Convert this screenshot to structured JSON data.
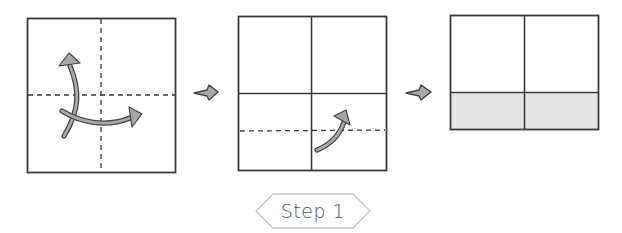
{
  "diagram": {
    "type": "origami-fold-instructions",
    "step_label": "Step 1",
    "colors": {
      "stroke": "#3a3a3a",
      "arrow_fill": "#a8a8a8",
      "arrow_stroke": "#444444",
      "shaded_fill": "#e4e4e4",
      "label_border": "#c8c8c8",
      "label_text": "#555555"
    },
    "frames": [
      {
        "id": 1,
        "description": "Square paper with dashed vertical and horizontal center fold lines; curved arrows indicating folding in half both ways",
        "lines": [
          "dashed-vertical-center",
          "dashed-horizontal-center"
        ],
        "arrows": [
          "curved-arrow-up",
          "curved-arrow-right"
        ]
      },
      {
        "id": 2,
        "description": "Unfolded square showing solid crease lines dividing into quarters; dashed line in lower half with curved arrow folding bottom edge up",
        "lines": [
          "solid-vertical-center",
          "solid-horizontal-center",
          "dashed-horizontal-lower"
        ],
        "arrows": [
          "curved-arrow-up"
        ]
      },
      {
        "id": 3,
        "description": "Result: paper with bottom edge folded up; folded flap shaded grey",
        "lines": [
          "solid-vertical-center",
          "solid-horizontal-fold"
        ],
        "shaded_region": "bottom-flap"
      }
    ],
    "transition_arrows": 2
  }
}
